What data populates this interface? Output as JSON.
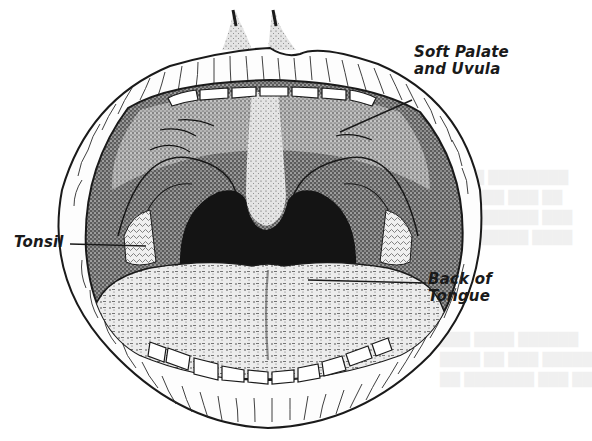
{
  "figure": {
    "ink_color": "#1a1a1a",
    "paper_color": "#ffffff",
    "throat_color": "#141414",
    "labels": {
      "soft_palate": {
        "line1": "Soft Palate",
        "line2": "and Uvula"
      },
      "tonsil": {
        "line1": "Tonsil"
      },
      "back_of_tongue": {
        "line1": "Back of",
        "line2": "Tongue"
      }
    }
  }
}
